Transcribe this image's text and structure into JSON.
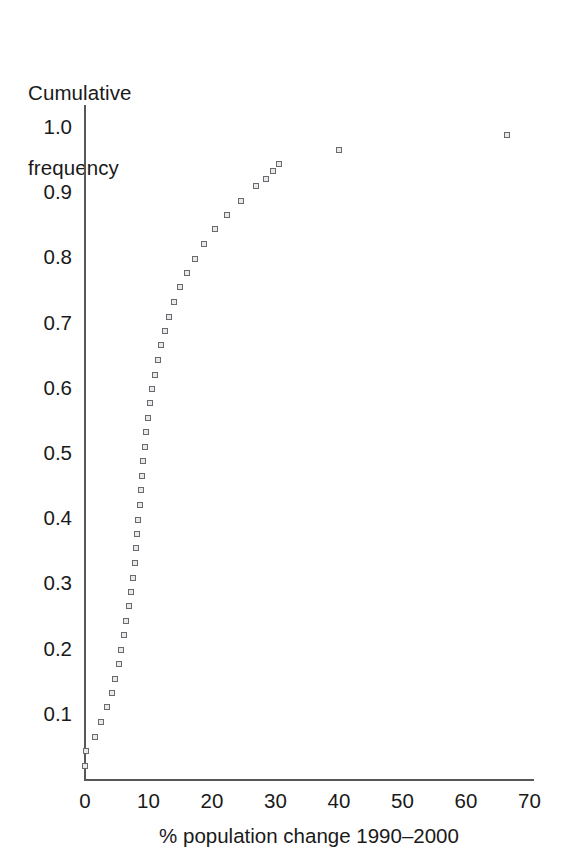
{
  "chart_data": {
    "type": "scatter",
    "title": "",
    "xlabel": "% population change 1990–2000",
    "ylabel": "Cumulative frequency",
    "ylabel_lines": [
      "Cumulative",
      "frequency"
    ],
    "xlim": [
      0,
      70
    ],
    "ylim": [
      0,
      1.0
    ],
    "xticks": [
      0,
      10,
      20,
      30,
      40,
      50,
      60,
      70
    ],
    "xtick_labels": [
      "0",
      "10",
      "20",
      "30",
      "40",
      "50",
      "60",
      "70"
    ],
    "yticks": [
      0.1,
      0.2,
      0.3,
      0.4,
      0.5,
      0.6,
      0.7,
      0.8,
      0.9,
      1.0
    ],
    "ytick_labels": [
      "0.1",
      "0.2",
      "0.3",
      "0.4",
      "0.5",
      "0.6",
      "0.7",
      "0.8",
      "0.9",
      "1.0"
    ],
    "grid": false,
    "legend": "none",
    "marker": "open-square",
    "marker_color": "#6a6a6e",
    "axis_color": "#58585a",
    "background": "#ffffff",
    "x": [
      0.0,
      0.2,
      1.6,
      2.5,
      3.4,
      4.3,
      4.8,
      5.3,
      5.7,
      6.1,
      6.5,
      6.9,
      7.2,
      7.5,
      7.8,
      8.0,
      8.2,
      8.4,
      8.6,
      8.8,
      9.0,
      9.2,
      9.4,
      9.6,
      9.9,
      10.2,
      10.6,
      11.0,
      11.5,
      12.0,
      12.6,
      13.2,
      14.0,
      14.9,
      16.0,
      17.3,
      18.7,
      20.4,
      22.4,
      24.6,
      26.9,
      28.5,
      29.6,
      30.6,
      40.0,
      66.5
    ],
    "y": [
      0.02,
      0.043,
      0.065,
      0.087,
      0.11,
      0.132,
      0.154,
      0.176,
      0.198,
      0.221,
      0.243,
      0.265,
      0.287,
      0.309,
      0.332,
      0.354,
      0.376,
      0.398,
      0.421,
      0.443,
      0.465,
      0.487,
      0.509,
      0.532,
      0.554,
      0.576,
      0.598,
      0.62,
      0.643,
      0.665,
      0.687,
      0.709,
      0.732,
      0.754,
      0.776,
      0.798,
      0.82,
      0.843,
      0.865,
      0.887,
      0.909,
      0.921,
      0.932,
      0.943,
      0.965,
      0.987
    ],
    "n_points": 46
  },
  "axes_geometry": {
    "x_origin_px": 85,
    "x_scale_px_per_unit": 6.35,
    "y_origin_px": 779,
    "y_scale_px_per_unit": 652
  }
}
